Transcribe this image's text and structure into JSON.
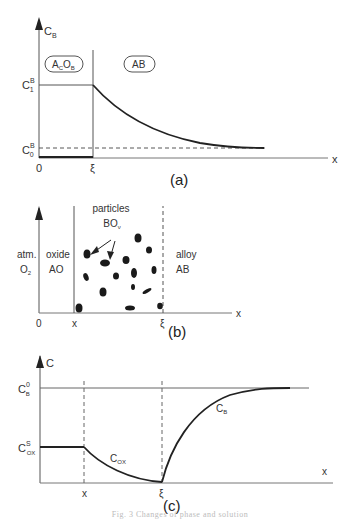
{
  "panels": {
    "a": {
      "label": "(a)",
      "y_axis": "C",
      "y_axis_sub": "B",
      "x_axis": "x",
      "origin": "0",
      "xi": "ξ",
      "tick_c1": "C",
      "tick_c1_sup": "B",
      "tick_c1_sub": "1",
      "tick_c0": "C",
      "tick_c0_sup": "B",
      "tick_c0_sub": "0",
      "region_left": "A",
      "region_left_sub1": "C",
      "region_left_mid": "O",
      "region_left_sub2": "B",
      "region_right": "AB"
    },
    "b": {
      "label": "(b)",
      "x_axis": "x",
      "origin": "0",
      "tick_x": "x",
      "xi": "ξ",
      "atm_line1": "atm.",
      "atm_line2": "O",
      "atm_sub": "2",
      "oxide_line1": "oxide",
      "oxide_line2": "AO",
      "particles_line1": "particles",
      "particles_line2": "BO",
      "particles_sub": "ν",
      "alloy_line1": "alloy",
      "alloy_line2": "AB"
    },
    "c": {
      "label": "(c)",
      "y_axis": "C",
      "x_axis": "x",
      "tick_x": "x",
      "xi": "ξ",
      "tick_cb0": "C",
      "tick_cb0_sup": "0",
      "tick_cb0_sub": "B",
      "tick_cox": "C",
      "tick_cox_sup": "S",
      "tick_cox_sub": "OX",
      "curve_cox": "C",
      "curve_cox_sub": "OX",
      "curve_cb": "C",
      "curve_cb_sub": "B"
    }
  },
  "caption": "Fig. 3  Changes of phase and solution"
}
